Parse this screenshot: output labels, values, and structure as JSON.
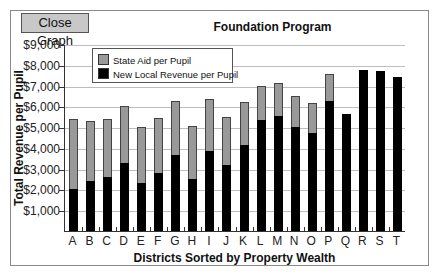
{
  "toolbar": {
    "close_graph_label": "Close Graph"
  },
  "colors": {
    "state_aid": "#999999",
    "local_revenue": "#000000",
    "grid": "#bdbdbd"
  },
  "chart_data": {
    "type": "bar",
    "stacked": true,
    "title": "Foundation Program",
    "xlabel": "Districts Sorted by Property Wealth",
    "ylabel": "Total Revenue per Pupil",
    "ylim": [
      0,
      9000
    ],
    "yticks": [
      "$1,000",
      "$2,000",
      "$3,000",
      "$4,000",
      "$5,000",
      "$6,000",
      "$7,000",
      "$8,000",
      "$9,000"
    ],
    "ytick_values": [
      1000,
      2000,
      3000,
      4000,
      5000,
      6000,
      7000,
      8000,
      9000
    ],
    "grid": true,
    "legend_position": "upper-left",
    "categories": [
      "A",
      "B",
      "C",
      "D",
      "E",
      "F",
      "G",
      "H",
      "I",
      "J",
      "K",
      "L",
      "M",
      "N",
      "O",
      "P",
      "Q",
      "R",
      "S",
      "T"
    ],
    "series": [
      {
        "name": "New Local Revenue per Pupil",
        "color": "#000000",
        "values": [
          2030,
          2410,
          2610,
          3260,
          2320,
          2800,
          3650,
          2490,
          3830,
          3180,
          4140,
          5320,
          5520,
          5000,
          4720,
          6260,
          5650,
          7740,
          7710,
          7420
        ]
      },
      {
        "name": "State Aid per Pupil",
        "color": "#999999",
        "values": [
          3350,
          2890,
          2800,
          2740,
          2710,
          2650,
          2600,
          2560,
          2530,
          2300,
          2060,
          1680,
          1620,
          1490,
          1450,
          1290,
          0,
          0,
          0,
          0
        ]
      }
    ],
    "totals": [
      5380,
      5300,
      5410,
      6000,
      5030,
      5450,
      6250,
      5050,
      6360,
      5480,
      6200,
      7000,
      7140,
      6490,
      6170,
      7550,
      5650,
      7740,
      7710,
      7420
    ]
  }
}
